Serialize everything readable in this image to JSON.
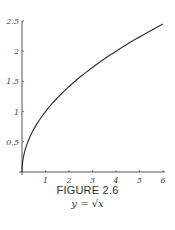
{
  "figure": {
    "label": "FIGURE 2.6",
    "equation": "y = √x"
  },
  "chart_data": {
    "type": "line",
    "title": "y = √x",
    "xlabel": "",
    "ylabel": "",
    "xlim": [
      0,
      6
    ],
    "ylim": [
      0,
      2.5
    ],
    "x_ticks": [
      "1",
      "2",
      "3",
      "4",
      "5",
      "6"
    ],
    "y_ticks": [
      "0.5",
      "1",
      "1.5",
      "2",
      "2.5"
    ],
    "grid": false,
    "series": [
      {
        "name": "y = sqrt(x)",
        "x": [
          0,
          0.1,
          0.25,
          0.5,
          1,
          1.5,
          2,
          2.5,
          3,
          3.5,
          4,
          4.5,
          5,
          5.5,
          6
        ],
        "y": [
          0,
          0.316,
          0.5,
          0.707,
          1,
          1.225,
          1.414,
          1.581,
          1.732,
          1.871,
          2,
          2.121,
          2.236,
          2.345,
          2.449
        ]
      }
    ]
  }
}
